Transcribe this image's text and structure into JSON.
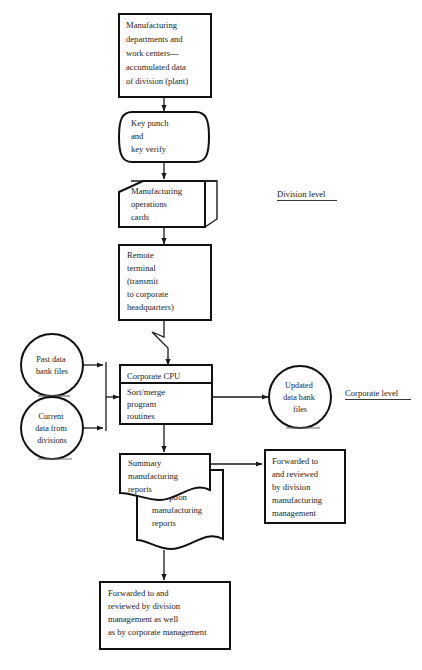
{
  "diagram": {
    "background_color": "#ffffff",
    "line_color": "#111111",
    "text_color": "#1c1c1c",
    "nodes": {
      "source": {
        "shape": "process-box",
        "lines": [
          "Manufacturing",
          "departments and",
          "work centers—",
          "accumulated data",
          "of division (plant)"
        ]
      },
      "keypunch": {
        "shape": "manual-operation-terminal",
        "lines": [
          "Key punch",
          "and",
          "key verify"
        ]
      },
      "cards": {
        "shape": "punched-card-deck",
        "lines": [
          "Manufacturing",
          "operations",
          "cards"
        ]
      },
      "remote_terminal": {
        "shape": "process-box",
        "lines": [
          "Remote",
          "terminal",
          "(transmit",
          "to corporate",
          "headquarters)"
        ]
      },
      "cpu": {
        "shape": "process-box-with-header",
        "header": "Corporate CPU",
        "lines": [
          "Sort/merge",
          "program",
          "routines"
        ]
      },
      "past_data": {
        "shape": "circle-connector",
        "lines": [
          "Past data",
          "bank files"
        ]
      },
      "current_data": {
        "shape": "circle-connector",
        "lines": [
          "Current",
          "data from",
          "divisions"
        ]
      },
      "updated_data": {
        "shape": "circle-connector",
        "lines": [
          "Updated",
          "data bank",
          "files"
        ]
      },
      "summary_reports": {
        "shape": "document",
        "lines": [
          "Summary",
          "manufacturing",
          "reports"
        ]
      },
      "exception_reports": {
        "shape": "document",
        "lines": [
          "Exception",
          "manufacturing",
          "reports"
        ]
      },
      "division_review": {
        "shape": "process-box",
        "lines": [
          "Forwarded to",
          "and reviewed",
          "by division",
          "manufacturing",
          "management"
        ]
      },
      "corporate_review": {
        "shape": "process-box",
        "lines": [
          "Forwarded to and",
          "reviewed by division",
          "management as well",
          "as by corporate management"
        ]
      }
    },
    "level_labels": {
      "division": "Division level",
      "corporate": "Corporate level"
    }
  }
}
